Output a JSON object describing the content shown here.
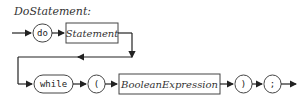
{
  "diagram": {
    "title": "DoStatement:",
    "type": "railroad-syntax-diagram",
    "row1": {
      "terminal_do": "do",
      "nonterminal_statement": "Statement"
    },
    "row2": {
      "terminal_while": "while",
      "terminal_lparen": "(",
      "nonterminal_boolean": "BooleanExpression",
      "terminal_rparen": ")",
      "terminal_semicolon": ";"
    }
  }
}
